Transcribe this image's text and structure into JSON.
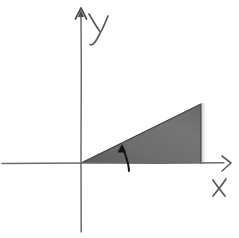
{
  "figure": {
    "title": "",
    "background_color": "#ffffff",
    "width": 239,
    "height": 238
  },
  "axes": {
    "x_axis": {
      "label": "X",
      "label_position": {
        "x": 219,
        "y": 190
      },
      "line": {
        "x1": 2,
        "y1": 163,
        "x2": 224,
        "y2": 163
      },
      "arrow_tip": {
        "x": 231,
        "y": 163
      },
      "color": "#6b6b6b",
      "stroke_width": 1.4
    },
    "y_axis": {
      "label": "y",
      "label_position": {
        "x": 95,
        "y": 24
      },
      "line": {
        "x1": 81,
        "y1": 232,
        "x2": 81,
        "y2": 14
      },
      "arrow_tip": {
        "x": 81,
        "y": 8
      },
      "color": "#6b6b6b",
      "stroke_width": 1.4
    },
    "origin": {
      "x": 81,
      "y": 163
    }
  },
  "shaded_region": {
    "name": "triangle-region",
    "shape": "right-triangle",
    "vertices": [
      {
        "x": 81,
        "y": 163
      },
      {
        "x": 201,
        "y": 104
      },
      {
        "x": 201,
        "y": 163
      }
    ],
    "fill_color": "#6f6f6f",
    "fill_color_light": "#8a8a8a",
    "fill_color_dark": "#5a5a5a",
    "edge_highlight_color": "#d9d9d9",
    "outline_color": "#4a4a4a"
  },
  "annotation_arrow": {
    "name": "region-pointer-arrow",
    "description": "curved arrow pointing up toward the hypotenuse",
    "path": "M128,170 C128,162 124,154 122,147",
    "tip": {
      "x": 122,
      "y": 145
    },
    "color": "#1a1a1a",
    "stroke_width": 2
  },
  "colors": {
    "ink": "#6b6b6b",
    "annotation_ink": "#1a1a1a",
    "fill": "#6f6f6f",
    "paper": "#ffffff"
  },
  "icons": {
    "x_axis_arrow": "arrow-right-icon",
    "y_axis_arrow": "arrow-up-icon",
    "pointer": "curved-arrow-icon"
  }
}
